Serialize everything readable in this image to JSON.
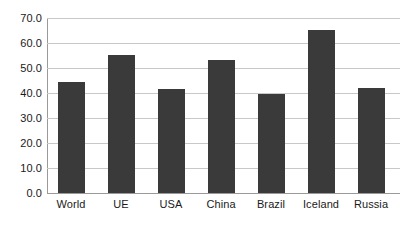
{
  "chart_data": {
    "type": "bar",
    "title": "",
    "subtitle": "",
    "xlabel": "",
    "ylabel": "",
    "categories": [
      "World",
      "UE",
      "USA",
      "China",
      "Brazil",
      "Iceland",
      "Russia"
    ],
    "values": [
      44.5,
      55.3,
      41.5,
      53.3,
      39.8,
      65.2,
      42.0
    ],
    "ylim": [
      0.0,
      70.0
    ],
    "ytick_labels": [
      "0.0",
      "10.0",
      "20.0",
      "30.0",
      "40.0",
      "50.0",
      "60.0",
      "70.0"
    ],
    "ytick_values": [
      0,
      10,
      20,
      30,
      40,
      50,
      60,
      70
    ],
    "grid": true,
    "grid_axis": "y",
    "legend": false,
    "legend_position": "none",
    "bar_color": "#3a3a3a",
    "grid_color": "#c8c8c8",
    "axis_color": "#9a9a9a",
    "background_color": "#ffffff"
  }
}
